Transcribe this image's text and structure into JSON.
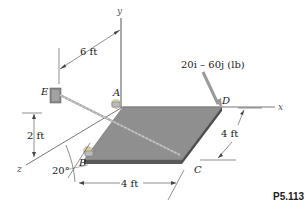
{
  "figure": {
    "problem_number": "P5.113",
    "axes": {
      "x": "x",
      "y": "y",
      "z": "z"
    },
    "points": {
      "A": "A",
      "B": "B",
      "C": "C",
      "D": "D",
      "E": "E"
    },
    "force_label": "20i – 60j (lb)",
    "dimensions": {
      "e_offset": "6 ft",
      "e_height": "2 ft",
      "plate_depth": "4 ft",
      "plate_width": "4 ft",
      "angle": "20°"
    },
    "colors": {
      "plate_top": "#8f8f8f",
      "plate_edge": "#5a5a5a",
      "cable": "#a9a9a9",
      "force_arrow": "#9a9a9a",
      "axis": "#555555"
    }
  }
}
